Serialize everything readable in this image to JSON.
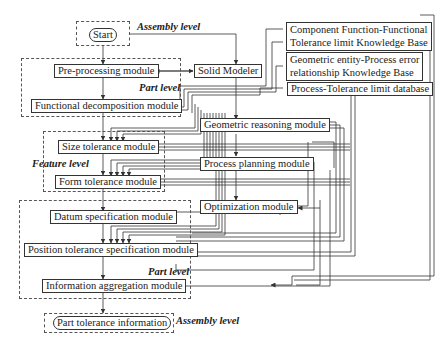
{
  "diagram": {
    "type": "flowchart",
    "nodes": {
      "start": "Start",
      "preprocessing": "Pre-processing module",
      "solid_modeler": "Solid Modeler",
      "functional_decomposition": "Functional decomposition module",
      "kb_function": [
        "Component Function-Functional",
        "Tolerance limit Knowledge Base"
      ],
      "kb_geometric": [
        "Geometric entity-Process error",
        "relationship Knowledge Base"
      ],
      "db_process": "Process-Tolerance limit database",
      "geometric_reasoning": "Geometric reasoning module",
      "size_tolerance": "Size tolerance module",
      "process_planning": "Process planning module",
      "form_tolerance": "Form tolerance module",
      "optimization": "Optimization module",
      "datum_specification": "Datum specification module",
      "position_tolerance": "Position tolerance specification module",
      "information_aggregation": "Information aggregation module",
      "part_tolerance_info": "Part tolerance information"
    },
    "levels": {
      "assembly_top": "Assembly level",
      "part_top": "Part level",
      "feature": "Feature level",
      "part_bottom": "Part level",
      "assembly_bottom": "Assembly level"
    },
    "line_color": "#333333",
    "dash_color": "#555555"
  }
}
